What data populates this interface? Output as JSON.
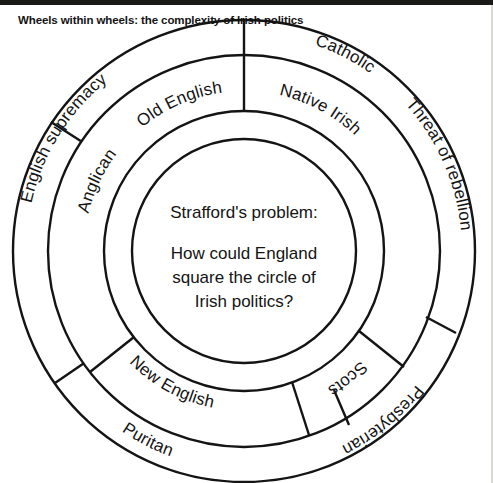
{
  "figure": {
    "title": "Wheels within wheels: the complexity of Irish politics",
    "center": {
      "heading": "Strafford's problem:",
      "body_line_1": "How could England",
      "body_line_2": "square the circle of",
      "body_line_3": "Irish politics?"
    },
    "rings": [
      {
        "name": "middle-ring",
        "segments": [
          {
            "label": "Native Irish"
          },
          {
            "label": "Scots"
          },
          {
            "label": "New English"
          },
          {
            "label": "Old English"
          }
        ]
      },
      {
        "name": "outer-ring",
        "segments": [
          {
            "label": "Catholic"
          },
          {
            "label": "Threat of rebellion"
          },
          {
            "label": "Presbyterian"
          },
          {
            "label": "Puritan"
          },
          {
            "label": "English supremacy"
          },
          {
            "label": "Anglican"
          }
        ]
      }
    ],
    "colors": {
      "stroke": "#141414",
      "background": "#ffffff",
      "text": "#141414"
    }
  }
}
